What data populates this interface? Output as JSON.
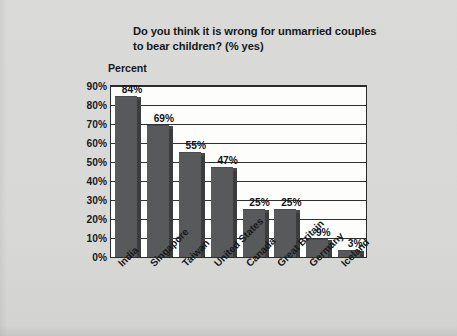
{
  "chart_data": {
    "type": "bar",
    "title": "Do you think it is wrong for unmarried couples to bear children? (% yes)",
    "title_line1": "Do you think it is wrong for unmarried couples",
    "title_line2": "to bear children? (% yes)",
    "ylabel": "Percent",
    "xlabel": "",
    "categories": [
      "India",
      "Singapore",
      "Taiwan",
      "United States",
      "Canada",
      "Great Britain",
      "Germany",
      "Iceland"
    ],
    "values": [
      84,
      69,
      55,
      47,
      25,
      25,
      9,
      3
    ],
    "value_labels": [
      "84%",
      "69%",
      "55%",
      "47%",
      "25%",
      "25%",
      "9%",
      "3%"
    ],
    "ylim": [
      0,
      90
    ],
    "ytick_values": [
      0,
      10,
      20,
      30,
      40,
      50,
      60,
      70,
      80,
      90
    ],
    "ytick_labels": [
      "0%",
      "10%",
      "20%",
      "30%",
      "40%",
      "50%",
      "60%",
      "70%",
      "80%",
      "90%"
    ],
    "grid": true,
    "legend": false,
    "legend_position": "none",
    "colors": {
      "bar_face": "#58595b",
      "bar_side": "#3b3c3e",
      "plot_background": "#fdfdfc",
      "page_background": "#d8d9d7",
      "axis": "#2b2c2e",
      "text": "#17181a"
    }
  }
}
